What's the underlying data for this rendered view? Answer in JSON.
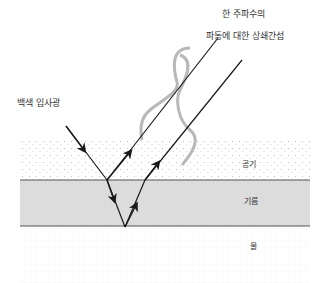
{
  "diagram": {
    "title_line1": "한 주파수의",
    "title_line2": "파동에 대한 상쇄간섭",
    "incident_label": "백색 입사광",
    "layers": [
      {
        "name": "공기",
        "fill": "#ffffff",
        "pattern": "dots"
      },
      {
        "name": "기름",
        "fill": "#dcdcdc",
        "pattern": "none"
      },
      {
        "name": "물",
        "fill": "#ffffff",
        "pattern": "grid"
      }
    ],
    "colors": {
      "ray": "#1a1a1a",
      "wave": "#b8b8b8",
      "oil": "#dcdcdc",
      "boundary": "#555555"
    }
  }
}
